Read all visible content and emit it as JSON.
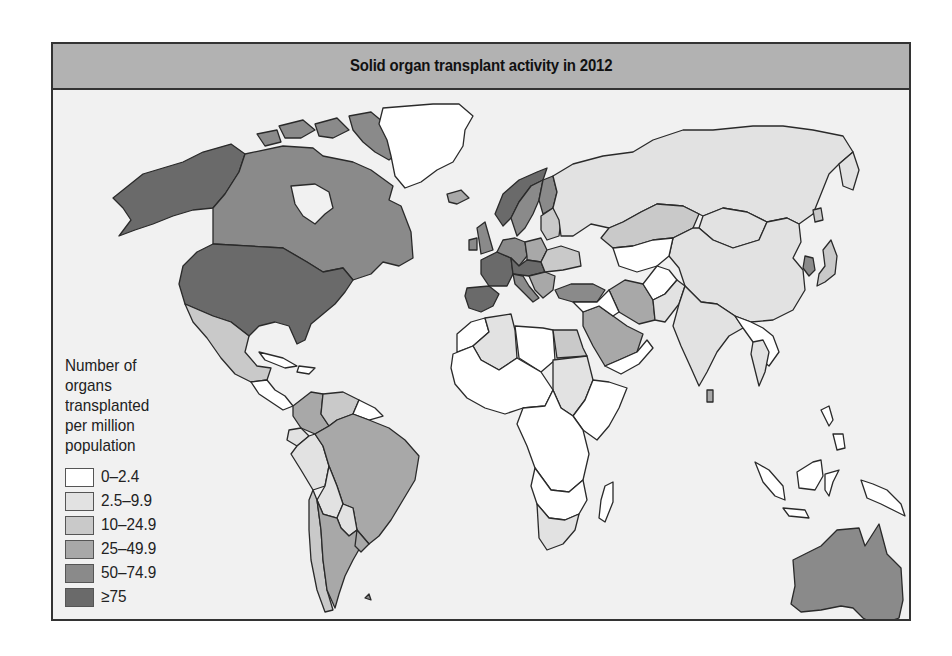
{
  "title": "Solid organ transplant activity in 2012",
  "legend": {
    "title_lines": [
      "Number of",
      "organs",
      "transplanted",
      "per million",
      "population"
    ],
    "items": [
      {
        "label": "0–2.4",
        "color": "#ffffff"
      },
      {
        "label": "2.5–9.9",
        "color": "#e2e2e2"
      },
      {
        "label": "10–24.9",
        "color": "#c9c9c9"
      },
      {
        "label": "25–49.9",
        "color": "#a8a8a8"
      },
      {
        "label": "50–74.9",
        "color": "#8a8a8a"
      },
      {
        "label": "≥75",
        "color": "#6a6a6a"
      }
    ]
  },
  "colors": {
    "background": "#f1f1f1",
    "header": "#b2b2b2",
    "border": "#333333"
  },
  "regions": [
    {
      "name": "Alaska (USA)",
      "class": "≥75"
    },
    {
      "name": "Canada",
      "class": "50–74.9"
    },
    {
      "name": "United States",
      "class": "≥75"
    },
    {
      "name": "Greenland",
      "class": "0–2.4"
    },
    {
      "name": "Mexico",
      "class": "10–24.9"
    },
    {
      "name": "Central America",
      "class": "0–2.4"
    },
    {
      "name": "Colombia",
      "class": "25–49.9"
    },
    {
      "name": "Venezuela",
      "class": "10–24.9"
    },
    {
      "name": "Guianas",
      "class": "0–2.4"
    },
    {
      "name": "Ecuador",
      "class": "2.5–9.9"
    },
    {
      "name": "Peru",
      "class": "2.5–9.9"
    },
    {
      "name": "Brazil",
      "class": "25–49.9"
    },
    {
      "name": "Bolivia",
      "class": "2.5–9.9"
    },
    {
      "name": "Paraguay",
      "class": "2.5–9.9"
    },
    {
      "name": "Chile",
      "class": "10–24.9"
    },
    {
      "name": "Argentina",
      "class": "25–49.9"
    },
    {
      "name": "Uruguay",
      "class": "25–49.9"
    },
    {
      "name": "Iceland",
      "class": "25–49.9"
    },
    {
      "name": "Norway",
      "class": "≥75"
    },
    {
      "name": "Sweden",
      "class": "50–74.9"
    },
    {
      "name": "Finland",
      "class": "50–74.9"
    },
    {
      "name": "United Kingdom",
      "class": "50–74.9"
    },
    {
      "name": "Ireland",
      "class": "50–74.9"
    },
    {
      "name": "France",
      "class": "≥75"
    },
    {
      "name": "Spain",
      "class": "≥75"
    },
    {
      "name": "Portugal",
      "class": "≥75"
    },
    {
      "name": "Germany",
      "class": "50–74.9"
    },
    {
      "name": "Poland",
      "class": "25–49.9"
    },
    {
      "name": "Italy",
      "class": "50–74.9"
    },
    {
      "name": "Russia",
      "class": "2.5–9.9"
    },
    {
      "name": "Turkey",
      "class": "50–74.9"
    },
    {
      "name": "Kazakhstan",
      "class": "10–24.9"
    },
    {
      "name": "Mongolia",
      "class": "2.5–9.9"
    },
    {
      "name": "China",
      "class": "2.5–9.9"
    },
    {
      "name": "Korea",
      "class": "50–74.9"
    },
    {
      "name": "Japan",
      "class": "10–24.9"
    },
    {
      "name": "Iran",
      "class": "25–49.9"
    },
    {
      "name": "Saudi Arabia",
      "class": "25–49.9"
    },
    {
      "name": "Pakistan",
      "class": "2.5–9.9"
    },
    {
      "name": "India",
      "class": "2.5–9.9"
    },
    {
      "name": "Thailand",
      "class": "2.5–9.9"
    },
    {
      "name": "Algeria",
      "class": "2.5–9.9"
    },
    {
      "name": "Egypt",
      "class": "10–24.9"
    },
    {
      "name": "Sudan",
      "class": "2.5–9.9"
    },
    {
      "name": "South Africa",
      "class": "2.5–9.9"
    },
    {
      "name": "Rest of Africa",
      "class": "0–2.4"
    },
    {
      "name": "Indonesia / SE Asia islands",
      "class": "0–2.4"
    },
    {
      "name": "Australia",
      "class": "50–74.9"
    },
    {
      "name": "New Zealand",
      "class": "25–49.9"
    }
  ]
}
